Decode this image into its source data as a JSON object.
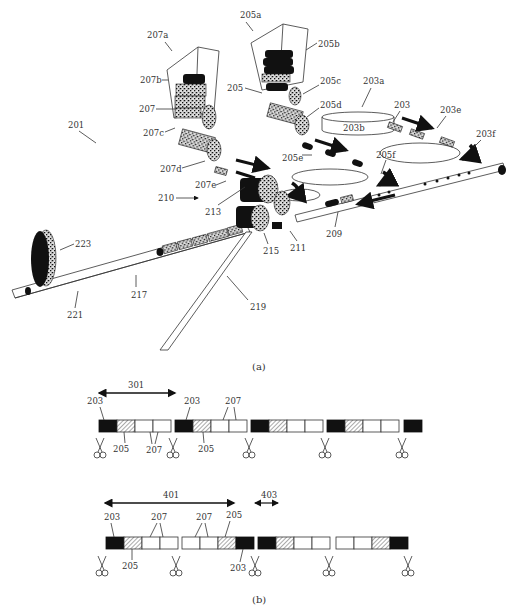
{
  "figure_a": {
    "caption": "(a)",
    "labels": {
      "l201": "201",
      "l203": "203",
      "l203a": "203a",
      "l203b": "203b",
      "l203e": "203e",
      "l203f": "203f",
      "l205": "205",
      "l205a": "205a",
      "l205b": "205b",
      "l205c": "205c",
      "l205d": "205d",
      "l205e": "205e",
      "l205f": "205f",
      "l207": "207",
      "l207a": "207a",
      "l207b": "207b",
      "l207c": "207c",
      "l207d": "207d",
      "l207e": "207e",
      "l209": "209",
      "l210": "210",
      "l211": "211",
      "l213": "213",
      "l215": "215",
      "l217": "217",
      "l219": "219",
      "l221": "221",
      "l223": "223"
    }
  },
  "figure_b": {
    "caption": "(b)",
    "row1": {
      "span_label": "301",
      "labels": {
        "a203": "203",
        "a205": "205",
        "a207": "207",
        "b203": "203",
        "b205": "205",
        "b207": "207"
      },
      "segments": [
        [
          "black",
          "hatch",
          "white",
          "white"
        ],
        [
          "black",
          "hatch",
          "white",
          "white"
        ],
        [
          "black",
          "hatch",
          "white",
          "white"
        ],
        [
          "black",
          "hatch",
          "white",
          "white"
        ],
        [
          "black"
        ]
      ],
      "cut_marks": 5
    },
    "row2": {
      "span_label": "401",
      "gap_label": "403",
      "labels": {
        "a203": "203",
        "a205": "205",
        "a207": "207",
        "b207": "207",
        "b205": "205",
        "b203": "203"
      },
      "segments": [
        [
          "black",
          "hatch",
          "white",
          "white"
        ],
        [
          "white",
          "white",
          "hatch",
          "black"
        ],
        [
          "black",
          "hatch",
          "white",
          "white"
        ],
        [
          "white",
          "white",
          "hatch",
          "black"
        ]
      ],
      "cut_marks": 5
    }
  }
}
